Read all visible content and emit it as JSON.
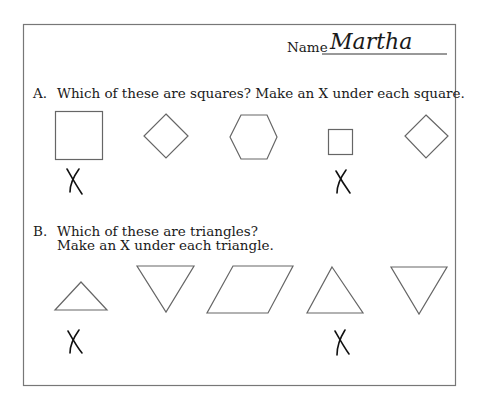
{
  "worksheet": {
    "name_label": "Name",
    "name_value": "Martha",
    "section_a": {
      "letter": "A.",
      "prompt": "Which of these are squares? Make an X under each square.",
      "shapes": [
        {
          "type": "square",
          "marked": true
        },
        {
          "type": "diamond",
          "marked": false
        },
        {
          "type": "hexagon",
          "marked": false
        },
        {
          "type": "small-square",
          "marked": true
        },
        {
          "type": "diamond",
          "marked": false
        }
      ],
      "mark": "X"
    },
    "section_b": {
      "letter": "B.",
      "prompt_line1": "Which of these are triangles?",
      "prompt_line2": "Make an X under each triangle.",
      "shapes": [
        {
          "type": "obtuse-triangle",
          "marked": true
        },
        {
          "type": "inverted-triangle",
          "marked": false
        },
        {
          "type": "parallelogram",
          "marked": false
        },
        {
          "type": "triangle",
          "marked": true
        },
        {
          "type": "inverted-triangle",
          "marked": false
        }
      ],
      "mark": "X"
    }
  }
}
